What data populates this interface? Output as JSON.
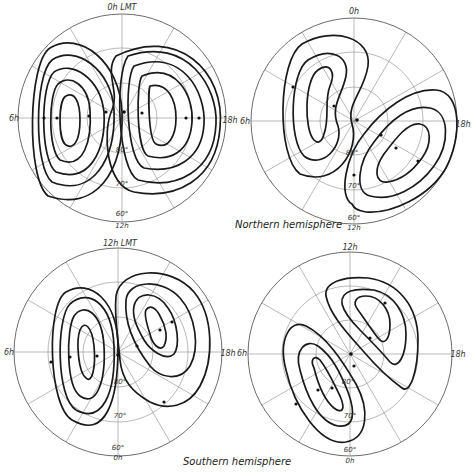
{
  "captions": {
    "northern": "Northern hemisphere",
    "southern": "Southern hemisphere"
  },
  "panels": [
    {
      "id": "north-left",
      "center": [
        122,
        118
      ],
      "radius": 104,
      "labels": {
        "top": "0h LMT",
        "left": "6h",
        "right": "18h",
        "bottom": "12h"
      },
      "lat_labels": {
        "l60": "60°",
        "l70": "70°",
        "l80": "80°"
      }
    },
    {
      "id": "north-right",
      "center": [
        354,
        121
      ],
      "radius": 103,
      "labels": {
        "top": "0h",
        "left": "6h",
        "right": "18h",
        "bottom": "12h"
      },
      "lat_labels": {
        "l60": "60°",
        "l70": "70°",
        "l80": "80°"
      }
    },
    {
      "id": "south-left",
      "center": [
        118,
        352
      ],
      "radius": 104,
      "labels": {
        "top": "12h LMT",
        "left": "6h",
        "right": "18h",
        "bottom": "0h"
      },
      "lat_labels": {
        "l60": "60°",
        "l70": "70°",
        "l80": "80°"
      }
    },
    {
      "id": "south-right",
      "center": [
        350,
        354
      ],
      "radius": 102,
      "labels": {
        "top": "12h",
        "left": "6h",
        "right": "18h",
        "bottom": "0h"
      },
      "lat_labels": {
        "l60": "60°",
        "l70": "70°",
        "l80": "80°"
      }
    }
  ],
  "colors": {
    "contour": "#1a1a1a",
    "grid": "#8a8a8a",
    "background": "#ffffff"
  }
}
